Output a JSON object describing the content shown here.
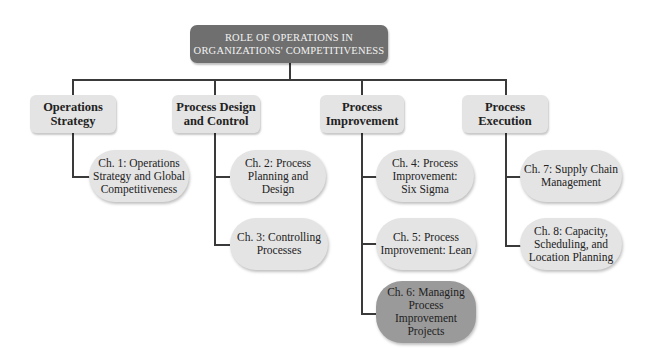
{
  "title": "ROLE OF OPERATIONS IN\nORGANIZATIONS' COMPETITIVENESS",
  "categories": [
    {
      "label": "Operations\nStrategy",
      "chapters": [
        {
          "label": "Ch. 1: Operations\nStrategy and Global\nCompetitiveness",
          "highlighted": false
        }
      ]
    },
    {
      "label": "Process Design\nand Control",
      "chapters": [
        {
          "label": "Ch. 2: Process\nPlanning and\nDesign",
          "highlighted": false
        },
        {
          "label": "Ch. 3: Controlling\nProcesses",
          "highlighted": false
        }
      ]
    },
    {
      "label": "Process\nImprovement",
      "chapters": [
        {
          "label": "Ch. 4: Process\nImprovement:\nSix Sigma",
          "highlighted": false
        },
        {
          "label": "Ch. 5: Process\nImprovement: Lean",
          "highlighted": false
        },
        {
          "label": "Ch. 6: Managing\nProcess\nImprovement\nProjects",
          "highlighted": true
        }
      ]
    },
    {
      "label": "Process\nExecution",
      "chapters": [
        {
          "label": "Ch. 7: Supply Chain\nManagement",
          "highlighted": false
        },
        {
          "label": "Ch. 8: Capacity,\nScheduling, and\nLocation Planning",
          "highlighted": false
        }
      ]
    }
  ],
  "colors": {
    "root_fill": "#6f6f6f",
    "box_fill": "#e4e4e4",
    "highlight_fill": "#9a9a9a",
    "connector": "#3a3a3a"
  }
}
